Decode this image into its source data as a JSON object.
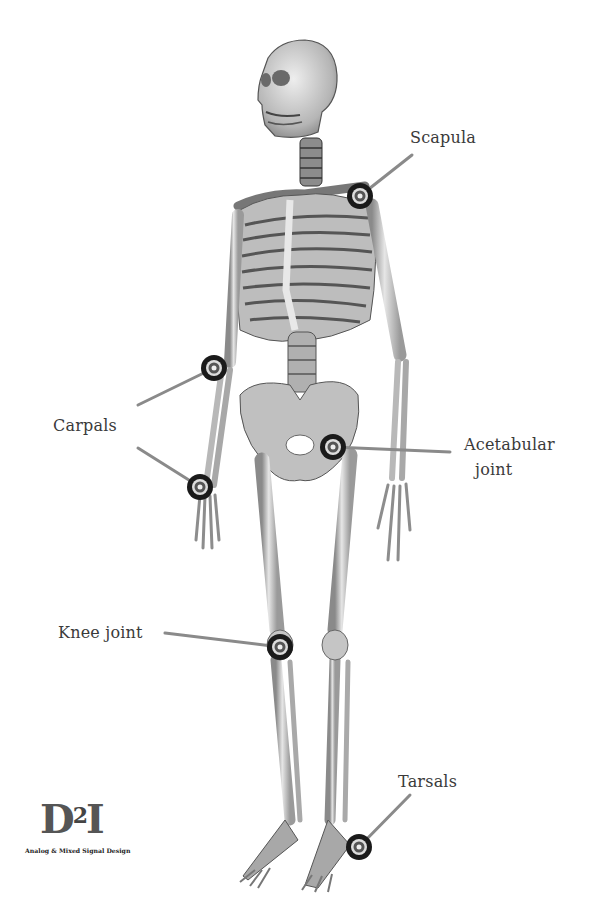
{
  "figure": {
    "type": "anatomical-diagram",
    "labels": [
      {
        "id": "scapula",
        "text": "Scapula"
      },
      {
        "id": "carpals",
        "text": "Carpals"
      },
      {
        "id": "acetabular",
        "line1": "Acetabular",
        "line2": "joint"
      },
      {
        "id": "knee",
        "text": "Knee joint"
      },
      {
        "id": "tarsals",
        "text": "Tarsals"
      }
    ],
    "markers": [
      {
        "id": "scapula-marker",
        "x": 360,
        "y": 196
      },
      {
        "id": "carpal-upper-marker",
        "x": 214,
        "y": 368
      },
      {
        "id": "carpal-lower-marker",
        "x": 200,
        "y": 487
      },
      {
        "id": "acetabular-marker",
        "x": 333,
        "y": 447
      },
      {
        "id": "knee-marker",
        "x": 280,
        "y": 647
      },
      {
        "id": "tarsal-marker",
        "x": 359,
        "y": 847
      }
    ]
  },
  "logo": {
    "main": "D",
    "superscript": "2",
    "suffix": "I",
    "tagline": "Analog & Mixed Signal Design"
  }
}
